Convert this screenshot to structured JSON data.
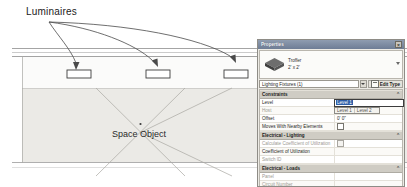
{
  "drawing": {
    "luminaires_label": "Luminaires",
    "space_label": "Space Object",
    "fixture_count": 3
  },
  "palette": {
    "title": "Properties",
    "close_label": "×",
    "preview": {
      "family": "Troffer",
      "size": "2' x 2'"
    },
    "type_selector": {
      "value": "Lighting Fixtures (1)",
      "edit_type_label": "Edit Type"
    },
    "sections": [
      {
        "name": "Constraints",
        "mark": "⌃",
        "rows": [
          {
            "name": "Level",
            "value": "Level 1",
            "dim": false,
            "editor": "level-combo",
            "options": [
              "Level 1",
              "Level 2"
            ]
          },
          {
            "name": "Host",
            "value": "Level : Level 1",
            "dim": true
          },
          {
            "name": "Offset",
            "value": "0' 0\"",
            "dim": false
          },
          {
            "name": "Moves With Nearby Elements",
            "value": "",
            "dim": false,
            "checkbox": true,
            "checked": false
          }
        ]
      },
      {
        "name": "Electrical - Lighting",
        "mark": "⌃",
        "rows": [
          {
            "name": "Calculate Coefficient of Utilization",
            "value": "",
            "dim": true,
            "checkbox": true,
            "checked": false
          },
          {
            "name": "Coefficient of Utilization",
            "value": "",
            "dim": false
          },
          {
            "name": "Switch ID",
            "value": "",
            "dim": true
          }
        ]
      },
      {
        "name": "Electrical - Loads",
        "mark": "⌃",
        "rows": [
          {
            "name": "Panel",
            "value": "",
            "dim": true
          },
          {
            "name": "Circuit Number",
            "value": "",
            "dim": true
          }
        ]
      },
      {
        "name": "Dimensions",
        "mark": "⌃",
        "rows": [
          {
            "name": "Elevation",
            "value": "0' 0\"",
            "dim": false
          }
        ]
      },
      {
        "name": "Identity Data",
        "mark": "⌃",
        "rows": []
      }
    ]
  },
  "colors": {
    "titlebar": "#6e7d95",
    "section_header": "#cfccc4",
    "selection_blue": "#2f5fa8",
    "space_fill": "#ebeae6"
  }
}
